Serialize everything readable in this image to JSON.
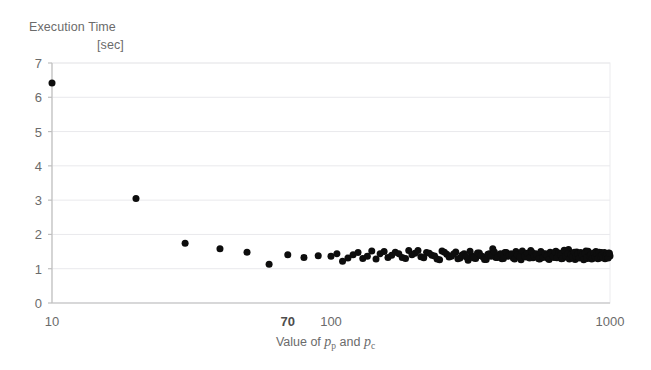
{
  "chart_data": {
    "type": "scatter",
    "title": "Execution Time [sec]",
    "title_lines": [
      "Execution Time",
      "[sec]"
    ],
    "ylabel": "Execution Time [sec]",
    "xlabel": "Value of p_p and p_c",
    "xlabel_parts": {
      "prefix": "Value of ",
      "var1": "p",
      "sub1": "p",
      "middle": " and ",
      "var2": "p",
      "sub2": "c"
    },
    "xscale": "log",
    "yscale": "linear",
    "xlim": [
      10,
      1000
    ],
    "ylim": [
      0,
      7
    ],
    "grid": true,
    "grid_axis": "y",
    "legend": "none",
    "marker": "circle",
    "marker_color": "#0d0d0d",
    "marker_size_px": 7,
    "yticks": [
      0,
      1,
      2,
      3,
      4,
      5,
      6,
      7
    ],
    "ytick_labels": [
      "0",
      "1",
      "2",
      "3",
      "4",
      "5",
      "6",
      "7"
    ],
    "xticks": [
      10,
      70,
      100,
      1000
    ],
    "xtick_labels": [
      "10",
      "70",
      "100",
      "1000"
    ],
    "series": [
      {
        "name": "Execution time",
        "points": [
          [
            10,
            6.42
          ],
          [
            20,
            3.05
          ],
          [
            30,
            1.74
          ],
          [
            40,
            1.58
          ],
          [
            50,
            1.48
          ],
          [
            60,
            1.13
          ],
          [
            70,
            1.41
          ],
          [
            80,
            1.33
          ],
          [
            90,
            1.38
          ],
          [
            100,
            1.36
          ],
          [
            110,
            1.22
          ],
          [
            120,
            1.41
          ],
          [
            130,
            1.3
          ],
          [
            140,
            1.52
          ],
          [
            150,
            1.44
          ],
          [
            160,
            1.33
          ],
          [
            170,
            1.48
          ],
          [
            180,
            1.33
          ],
          [
            190,
            1.53
          ],
          [
            200,
            1.45
          ],
          [
            210,
            1.35
          ],
          [
            220,
            1.47
          ],
          [
            230,
            1.39
          ],
          [
            240,
            1.28
          ],
          [
            250,
            1.52
          ],
          [
            260,
            1.42
          ],
          [
            270,
            1.36
          ],
          [
            280,
            1.49
          ],
          [
            290,
            1.31
          ],
          [
            300,
            1.44
          ],
          [
            310,
            1.25
          ],
          [
            320,
            1.38
          ],
          [
            330,
            1.3
          ],
          [
            340,
            1.46
          ],
          [
            350,
            1.35
          ],
          [
            360,
            1.27
          ],
          [
            370,
            1.44
          ],
          [
            380,
            1.58
          ],
          [
            390,
            1.33
          ],
          [
            400,
            1.4
          ],
          [
            410,
            1.29
          ],
          [
            420,
            1.47
          ],
          [
            430,
            1.36
          ],
          [
            440,
            1.43
          ],
          [
            450,
            1.31
          ],
          [
            460,
            1.5
          ],
          [
            470,
            1.38
          ],
          [
            480,
            1.26
          ],
          [
            490,
            1.45
          ],
          [
            500,
            1.34
          ],
          [
            510,
            1.41
          ],
          [
            520,
            1.53
          ],
          [
            530,
            1.32
          ],
          [
            540,
            1.44
          ],
          [
            550,
            1.37
          ],
          [
            560,
            1.28
          ],
          [
            570,
            1.46
          ],
          [
            580,
            1.35
          ],
          [
            590,
            1.42
          ],
          [
            600,
            1.3
          ],
          [
            610,
            1.48
          ],
          [
            620,
            1.39
          ],
          [
            630,
            1.33
          ],
          [
            640,
            1.51
          ],
          [
            650,
            1.36
          ],
          [
            660,
            1.43
          ],
          [
            670,
            1.29
          ],
          [
            680,
            1.47
          ],
          [
            690,
            1.34
          ],
          [
            700,
            1.4
          ],
          [
            710,
            1.56
          ],
          [
            720,
            1.31
          ],
          [
            730,
            1.45
          ],
          [
            740,
            1.37
          ],
          [
            750,
            1.27
          ],
          [
            760,
            1.49
          ],
          [
            770,
            1.38
          ],
          [
            780,
            1.44
          ],
          [
            790,
            1.32
          ],
          [
            800,
            1.41
          ],
          [
            810,
            1.35
          ],
          [
            820,
            1.52
          ],
          [
            830,
            1.3
          ],
          [
            840,
            1.46
          ],
          [
            850,
            1.39
          ],
          [
            860,
            1.28
          ],
          [
            870,
            1.43
          ],
          [
            880,
            1.36
          ],
          [
            890,
            1.5
          ],
          [
            900,
            1.33
          ],
          [
            910,
            1.42
          ],
          [
            920,
            1.31
          ],
          [
            930,
            1.47
          ],
          [
            940,
            1.38
          ],
          [
            950,
            1.44
          ],
          [
            960,
            1.29
          ],
          [
            970,
            1.4
          ],
          [
            980,
            1.35
          ],
          [
            990,
            1.46
          ],
          [
            1000,
            1.37
          ],
          [
            105,
            1.44
          ],
          [
            115,
            1.31
          ],
          [
            125,
            1.47
          ],
          [
            135,
            1.36
          ],
          [
            145,
            1.28
          ],
          [
            155,
            1.5
          ],
          [
            165,
            1.39
          ],
          [
            175,
            1.44
          ],
          [
            185,
            1.3
          ],
          [
            195,
            1.41
          ],
          [
            205,
            1.53
          ],
          [
            215,
            1.32
          ],
          [
            225,
            1.45
          ],
          [
            235,
            1.37
          ],
          [
            245,
            1.26
          ],
          [
            255,
            1.48
          ],
          [
            265,
            1.34
          ],
          [
            275,
            1.43
          ],
          [
            285,
            1.29
          ],
          [
            295,
            1.4
          ],
          [
            305,
            1.35
          ],
          [
            315,
            1.51
          ],
          [
            325,
            1.31
          ],
          [
            335,
            1.46
          ],
          [
            345,
            1.38
          ],
          [
            355,
            1.27
          ],
          [
            365,
            1.42
          ],
          [
            375,
            1.36
          ],
          [
            385,
            1.49
          ],
          [
            395,
            1.33
          ],
          [
            405,
            1.44
          ],
          [
            415,
            1.3
          ],
          [
            425,
            1.47
          ],
          [
            435,
            1.39
          ],
          [
            445,
            1.43
          ],
          [
            455,
            1.28
          ],
          [
            465,
            1.41
          ],
          [
            475,
            1.34
          ],
          [
            485,
            1.52
          ],
          [
            495,
            1.37
          ],
          [
            505,
            1.45
          ],
          [
            515,
            1.31
          ],
          [
            525,
            1.48
          ],
          [
            535,
            1.36
          ],
          [
            545,
            1.42
          ],
          [
            555,
            1.29
          ],
          [
            565,
            1.5
          ],
          [
            575,
            1.33
          ],
          [
            585,
            1.44
          ],
          [
            595,
            1.38
          ],
          [
            605,
            1.27
          ],
          [
            615,
            1.43
          ],
          [
            625,
            1.35
          ],
          [
            635,
            1.49
          ],
          [
            645,
            1.32
          ],
          [
            655,
            1.46
          ],
          [
            665,
            1.4
          ],
          [
            675,
            1.3
          ],
          [
            685,
            1.54
          ],
          [
            695,
            1.37
          ],
          [
            705,
            1.44
          ],
          [
            715,
            1.28
          ],
          [
            725,
            1.41
          ],
          [
            735,
            1.34
          ],
          [
            745,
            1.48
          ],
          [
            755,
            1.36
          ],
          [
            765,
            1.43
          ],
          [
            775,
            1.31
          ],
          [
            785,
            1.47
          ],
          [
            795,
            1.39
          ],
          [
            805,
            1.26
          ],
          [
            815,
            1.45
          ],
          [
            825,
            1.33
          ],
          [
            835,
            1.51
          ],
          [
            845,
            1.37
          ],
          [
            855,
            1.42
          ],
          [
            865,
            1.3
          ],
          [
            875,
            1.46
          ],
          [
            885,
            1.34
          ],
          [
            895,
            1.44
          ],
          [
            905,
            1.29
          ],
          [
            915,
            1.48
          ],
          [
            925,
            1.36
          ],
          [
            935,
            1.41
          ],
          [
            945,
            1.32
          ],
          [
            955,
            1.47
          ],
          [
            965,
            1.38
          ],
          [
            975,
            1.43
          ],
          [
            985,
            1.31
          ],
          [
            995,
            1.45
          ]
        ]
      }
    ]
  },
  "plot_geometry": {
    "left": 52,
    "right": 610,
    "top": 63,
    "bottom": 303
  }
}
